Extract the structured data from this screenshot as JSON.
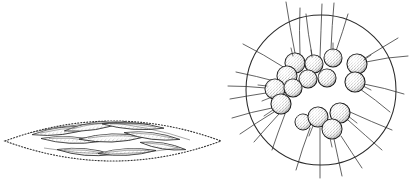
{
  "figure": {
    "title": "Two colonial microorganism forms",
    "background_color": "#ffffff",
    "ink_color": "#1a1a1a",
    "stipple_color": "#555555",
    "width": 417,
    "height": 184,
    "panels": [
      {
        "id": "left-panel",
        "name": "fusiform-cell-colony",
        "label": "Elongated lens-shaped colony with dotted mucilage envelope",
        "envelope": {
          "outline_style": "dotted",
          "shape": "lens",
          "center_x": 113,
          "center_y": 141,
          "half_width": 108,
          "half_height": 31
        },
        "cell_type": "fusiform",
        "cell_count": 9,
        "cells": [
          {
            "cx": 62,
            "cy": 131,
            "len": 60,
            "thick": 10,
            "angle": -7
          },
          {
            "cx": 95,
            "cy": 126,
            "len": 62,
            "thick": 10,
            "angle": -9
          },
          {
            "cx": 133,
            "cy": 126,
            "len": 62,
            "thick": 9,
            "angle": 4
          },
          {
            "cx": 70,
            "cy": 140,
            "len": 58,
            "thick": 9,
            "angle": 3
          },
          {
            "cx": 112,
            "cy": 138,
            "len": 66,
            "thick": 11,
            "angle": -2
          },
          {
            "cx": 152,
            "cy": 136,
            "len": 56,
            "thick": 10,
            "angle": 7
          },
          {
            "cx": 85,
            "cy": 152,
            "len": 56,
            "thick": 10,
            "angle": 5
          },
          {
            "cx": 127,
            "cy": 152,
            "len": 58,
            "thick": 10,
            "angle": -3
          },
          {
            "cx": 163,
            "cy": 146,
            "len": 46,
            "thick": 9,
            "angle": 9
          }
        ]
      },
      {
        "id": "right-panel",
        "name": "spherical-cell-colony",
        "label": "Circular colony with radiating bristles and spherical cells",
        "envelope": {
          "outline_style": "solid",
          "shape": "circle",
          "center_x": 321,
          "center_y": 90,
          "radius": 75
        },
        "cell_type": "spherical",
        "cell_count": 14,
        "bristle_count": 24,
        "cells": [
          {
            "cx": 295,
            "cy": 63,
            "r": 10
          },
          {
            "cx": 314,
            "cy": 64,
            "r": 9
          },
          {
            "cx": 333,
            "cy": 58,
            "r": 9
          },
          {
            "cx": 357,
            "cy": 64,
            "r": 10
          },
          {
            "cx": 287,
            "cy": 76,
            "r": 10
          },
          {
            "cx": 308,
            "cy": 79,
            "r": 9
          },
          {
            "cx": 327,
            "cy": 78,
            "r": 9
          },
          {
            "cx": 355,
            "cy": 82,
            "r": 10
          },
          {
            "cx": 275,
            "cy": 89,
            "r": 10
          },
          {
            "cx": 293,
            "cy": 88,
            "r": 9
          },
          {
            "cx": 281,
            "cy": 104,
            "r": 10
          },
          {
            "cx": 318,
            "cy": 117,
            "r": 10
          },
          {
            "cx": 340,
            "cy": 113,
            "r": 10
          },
          {
            "cx": 332,
            "cy": 129,
            "r": 10
          },
          {
            "cx": 303,
            "cy": 122,
            "r": 8
          }
        ],
        "bristles": [
          {
            "x1": 295,
            "y1": 53,
            "x2": 286,
            "y2": 2
          },
          {
            "x1": 300,
            "y1": 54,
            "x2": 300,
            "y2": 8
          },
          {
            "x1": 312,
            "y1": 55,
            "x2": 306,
            "y2": 14
          },
          {
            "x1": 320,
            "y1": 57,
            "x2": 322,
            "y2": 4
          },
          {
            "x1": 331,
            "y1": 49,
            "x2": 334,
            "y2": 3
          },
          {
            "x1": 336,
            "y1": 51,
            "x2": 348,
            "y2": 14
          },
          {
            "x1": 365,
            "y1": 58,
            "x2": 398,
            "y2": 38
          },
          {
            "x1": 366,
            "y1": 62,
            "x2": 408,
            "y2": 56
          },
          {
            "x1": 364,
            "y1": 84,
            "x2": 404,
            "y2": 94
          },
          {
            "x1": 360,
            "y1": 89,
            "x2": 390,
            "y2": 112
          },
          {
            "x1": 285,
            "y1": 68,
            "x2": 243,
            "y2": 44
          },
          {
            "x1": 278,
            "y1": 82,
            "x2": 236,
            "y2": 72
          },
          {
            "x1": 266,
            "y1": 88,
            "x2": 228,
            "y2": 86
          },
          {
            "x1": 266,
            "y1": 93,
            "x2": 230,
            "y2": 99
          },
          {
            "x1": 272,
            "y1": 108,
            "x2": 232,
            "y2": 118
          },
          {
            "x1": 274,
            "y1": 112,
            "x2": 240,
            "y2": 134
          },
          {
            "x1": 279,
            "y1": 114,
            "x2": 254,
            "y2": 142
          },
          {
            "x1": 285,
            "y1": 114,
            "x2": 272,
            "y2": 150
          },
          {
            "x1": 310,
            "y1": 128,
            "x2": 296,
            "y2": 170
          },
          {
            "x1": 320,
            "y1": 128,
            "x2": 320,
            "y2": 178
          },
          {
            "x1": 334,
            "y1": 139,
            "x2": 342,
            "y2": 176
          },
          {
            "x1": 341,
            "y1": 136,
            "x2": 362,
            "y2": 168
          },
          {
            "x1": 348,
            "y1": 120,
            "x2": 382,
            "y2": 150
          },
          {
            "x1": 350,
            "y1": 112,
            "x2": 392,
            "y2": 130
          }
        ]
      }
    ]
  }
}
